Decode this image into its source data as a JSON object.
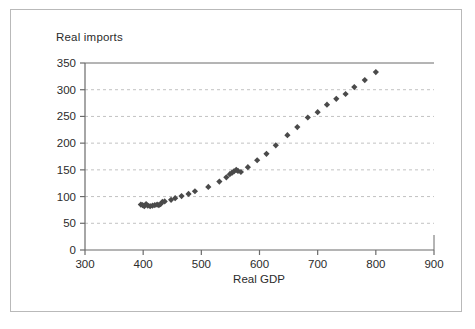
{
  "figure": {
    "background_color": "#ffffff",
    "frame_color": "#b9b9b9"
  },
  "chart_data": {
    "type": "scatter",
    "title": "Real imports",
    "xlabel": "Real GDP",
    "ylabel": "",
    "xlim": [
      300,
      900
    ],
    "ylim": [
      0,
      350
    ],
    "xticks": [
      300,
      400,
      500,
      600,
      700,
      800,
      900
    ],
    "yticks": [
      0,
      50,
      100,
      150,
      200,
      250,
      300,
      350
    ],
    "grid": "horizontal-dashed",
    "legend": "none",
    "marker": "diamond",
    "marker_color": "#4a4a4a",
    "series": [
      {
        "name": "Real imports vs Real GDP",
        "points": [
          [
            396,
            85
          ],
          [
            399,
            84
          ],
          [
            402,
            82
          ],
          [
            405,
            86
          ],
          [
            408,
            83
          ],
          [
            412,
            82
          ],
          [
            416,
            83
          ],
          [
            420,
            84
          ],
          [
            424,
            85
          ],
          [
            427,
            84
          ],
          [
            430,
            86
          ],
          [
            433,
            90
          ],
          [
            437,
            91
          ],
          [
            448,
            94
          ],
          [
            455,
            97
          ],
          [
            466,
            101
          ],
          [
            478,
            105
          ],
          [
            489,
            110
          ],
          [
            512,
            118
          ],
          [
            531,
            128
          ],
          [
            543,
            136
          ],
          [
            549,
            142
          ],
          [
            553,
            145
          ],
          [
            556,
            147
          ],
          [
            560,
            150
          ],
          [
            563,
            148
          ],
          [
            568,
            146
          ],
          [
            580,
            155
          ],
          [
            596,
            168
          ],
          [
            612,
            180
          ],
          [
            628,
            196
          ],
          [
            648,
            215
          ],
          [
            665,
            230
          ],
          [
            683,
            248
          ],
          [
            700,
            258
          ],
          [
            716,
            272
          ],
          [
            732,
            283
          ],
          [
            748,
            292
          ],
          [
            763,
            305
          ],
          [
            781,
            318
          ],
          [
            800,
            333
          ]
        ]
      }
    ]
  }
}
